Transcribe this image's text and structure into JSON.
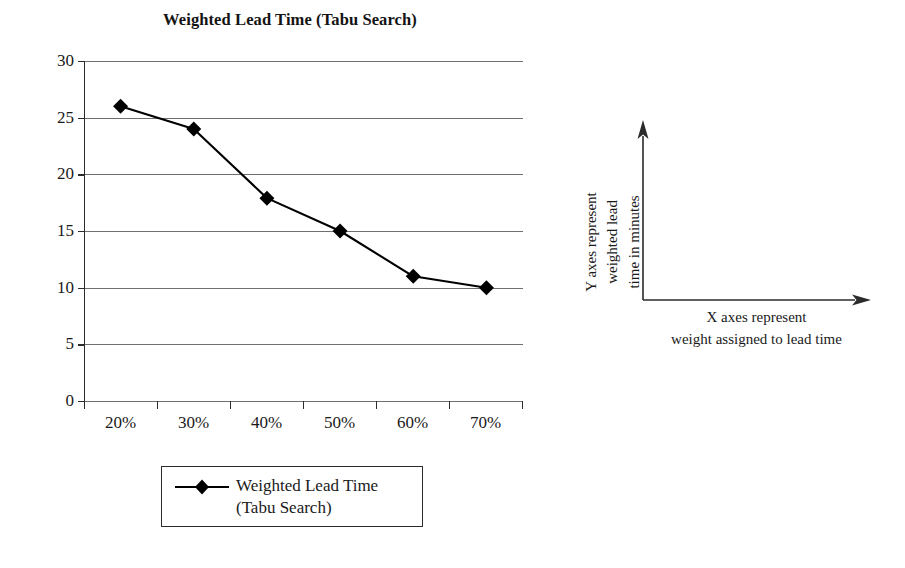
{
  "chart_data": {
    "type": "line",
    "title": "Weighted Lead Time (Tabu Search)",
    "categories": [
      "20%",
      "30%",
      "40%",
      "50%",
      "60%",
      "70%"
    ],
    "values": [
      26,
      24,
      17.9,
      15,
      11,
      10
    ],
    "series": [
      {
        "name": "Weighted Lead Time (Tabu Search)",
        "values": [
          26,
          24,
          17.9,
          15,
          11,
          10
        ],
        "marker": "diamond",
        "color": "#000000"
      }
    ],
    "xlabel": "X axes represent weight assigned to lead time",
    "ylabel": "Y axes represent weighted lead time in minutes",
    "ylim": [
      0,
      30
    ],
    "yticks": [
      0,
      5,
      10,
      15,
      20,
      25,
      30
    ],
    "ytick_labels": [
      "0",
      "5",
      "10",
      "15",
      "20",
      "25",
      "30"
    ],
    "grid": true,
    "grid_axis": "y",
    "legend_position": "bottom",
    "legend_entries": [
      "Weighted Lead Time",
      "(Tabu Search)"
    ]
  },
  "legend": {
    "line1": "Weighted Lead Time",
    "line2": "(Tabu Search)",
    "marker_name": "diamond-marker"
  },
  "annotation": {
    "y_line1": "Y axes represent",
    "y_line2": "weighted lead",
    "y_line3": "time in minutes",
    "x_line1": "X axes represent",
    "x_line2": "weight assigned to lead time"
  },
  "colors": {
    "series": "#000000",
    "gridline": "#6f6f6f",
    "axis": "#2b2b2b",
    "text": "#1a1a1a",
    "background": "#ffffff"
  }
}
